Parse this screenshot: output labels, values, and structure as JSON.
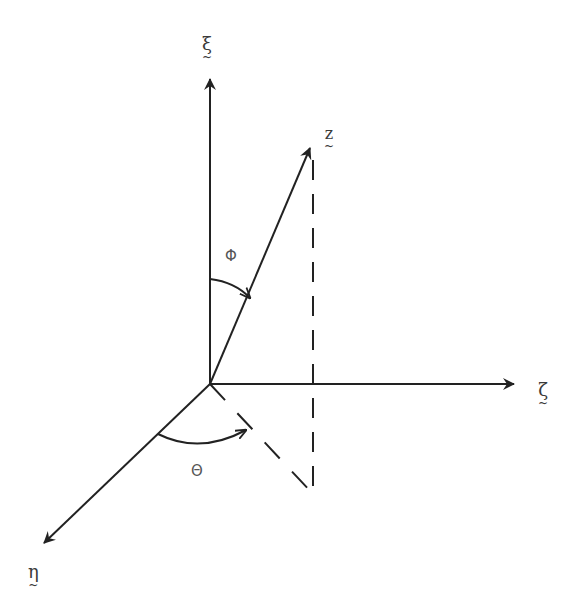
{
  "diagram": {
    "title": "",
    "stroke_color": "#222222",
    "origin": [
      210,
      384
    ],
    "axes": [
      {
        "id": "xi",
        "label": "ξ",
        "underline": "~",
        "tip": [
          210,
          77
        ],
        "label_pos": [
          202,
          35
        ]
      },
      {
        "id": "zeta",
        "label": "ζ",
        "underline": "~",
        "tip": [
          516,
          384
        ],
        "label_pos": [
          539,
          383
        ]
      },
      {
        "id": "eta",
        "label": "η",
        "underline": "~",
        "tip": [
          42,
          544
        ],
        "label_pos": [
          30,
          565
        ]
      }
    ],
    "vector": {
      "id": "z",
      "label": "z",
      "underline": "~",
      "tip": [
        311,
        146
      ],
      "label_pos": [
        326,
        127
      ]
    },
    "projection_lines": [
      {
        "from": [
          313,
          160
        ],
        "to": [
          313,
          494
        ],
        "style": "dashed"
      },
      {
        "from": [
          210,
          384
        ],
        "to": [
          313,
          494
        ],
        "style": "dashed"
      }
    ],
    "angles": [
      {
        "id": "phi",
        "label": "Φ",
        "label_pos": [
          225,
          248
        ],
        "between": [
          "xi",
          "z"
        ]
      },
      {
        "id": "theta",
        "label": "Θ",
        "label_pos": [
          191,
          463
        ],
        "between": [
          "eta",
          "projection"
        ]
      }
    ]
  }
}
